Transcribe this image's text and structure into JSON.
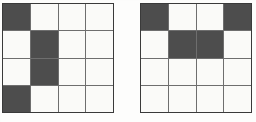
{
  "figure": {
    "background_color": "#fdfdfc",
    "filled_color": "#4d4d4d",
    "empty_color": "#fafaf8",
    "gridline_color": "#6e6e6e",
    "outline_color": "#3a3a3a",
    "rows": 4,
    "columns": 4,
    "panel_count": 2
  },
  "panels": [
    {
      "name": "left-grid",
      "label": "",
      "position": {
        "left": 2,
        "top": 3,
        "width": 112,
        "height": 110
      },
      "rows": 4,
      "columns": 4,
      "cells": [
        [
          1,
          0,
          0,
          0
        ],
        [
          0,
          1,
          0,
          0
        ],
        [
          0,
          1,
          0,
          0
        ],
        [
          1,
          0,
          0,
          0
        ]
      ],
      "filled_count": 4
    },
    {
      "name": "right-grid",
      "label": "",
      "position": {
        "left": 140,
        "top": 3,
        "width": 112,
        "height": 110
      },
      "rows": 4,
      "columns": 4,
      "cells": [
        [
          1,
          0,
          0,
          1
        ],
        [
          0,
          1,
          1,
          0
        ],
        [
          0,
          0,
          0,
          0
        ],
        [
          0,
          0,
          0,
          0
        ]
      ],
      "filled_count": 4
    }
  ],
  "chart_data": {
    "type": "heatmap",
    "xlabel": "",
    "ylabel": "",
    "categories": [
      "1",
      "2",
      "3",
      "4"
    ],
    "row_labels": [
      "1",
      "2",
      "3",
      "4"
    ],
    "legend": [],
    "grid": true,
    "series": [
      {
        "name": "left-grid",
        "values": [
          [
            1,
            0,
            0,
            0
          ],
          [
            0,
            1,
            0,
            0
          ],
          [
            0,
            1,
            0,
            0
          ],
          [
            1,
            0,
            0,
            0
          ]
        ]
      },
      {
        "name": "right-grid",
        "values": [
          [
            1,
            0,
            0,
            1
          ],
          [
            0,
            1,
            1,
            0
          ],
          [
            0,
            0,
            0,
            0
          ],
          [
            0,
            0,
            0,
            0
          ]
        ]
      }
    ]
  }
}
